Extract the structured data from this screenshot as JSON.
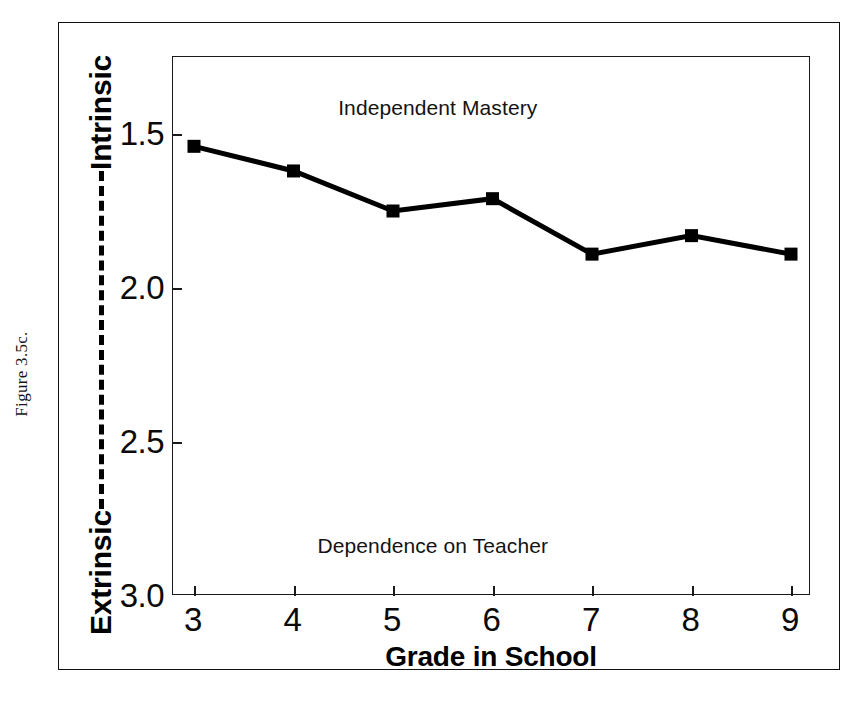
{
  "figure": {
    "caption": "Figure 3.5c.",
    "background_color": "#ffffff",
    "ink_color": "#000000"
  },
  "axes": {
    "y_label_high": "Intrinsic",
    "y_label_low": "Extrinsic",
    "y_connector_style": "dashed",
    "y_tick_labels": [
      "3.0",
      "2.5",
      "2.0",
      "1.5"
    ],
    "x_tick_labels": [
      "3",
      "4",
      "5",
      "6",
      "7",
      "8",
      "9"
    ],
    "x_title": "Grade in School"
  },
  "annotations": {
    "top": "Independent Mastery",
    "bottom": "Dependence on Teacher"
  },
  "chart_data": {
    "type": "line",
    "title": "",
    "subtitle": "",
    "xlabel": "Grade in School",
    "ylabel": "Extrinsic — Intrinsic",
    "categories": [
      "3",
      "4",
      "5",
      "6",
      "7",
      "8",
      "9"
    ],
    "x": [
      3,
      4,
      5,
      6,
      7,
      8,
      9
    ],
    "values": [
      2.96,
      2.88,
      2.75,
      2.79,
      2.61,
      2.67,
      2.61
    ],
    "series": [
      {
        "name": "Independent Mastery vs Dependence on Teacher",
        "values": [
          2.96,
          2.88,
          2.75,
          2.79,
          2.61,
          2.67,
          2.61
        ],
        "color": "#000000",
        "marker": "square",
        "marker_size": 13,
        "line_width": 5
      }
    ],
    "xlim": [
      3,
      9
    ],
    "ylim": [
      1.5,
      3.25
    ],
    "y_ticks": [
      1.5,
      2.0,
      2.5,
      3.0
    ],
    "x_ticks": [
      3,
      4,
      5,
      6,
      7,
      8,
      9
    ],
    "grid": false,
    "legend": false,
    "legend_position": "none",
    "annotations": [
      {
        "text": "Independent Mastery",
        "x": 5.45,
        "y": 3.08
      },
      {
        "text": "Dependence on Teacher",
        "x": 5.4,
        "y": 1.66
      }
    ]
  }
}
